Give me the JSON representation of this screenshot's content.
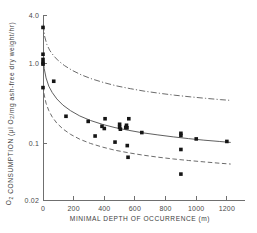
{
  "chart_data": {
    "type": "scatter",
    "title": "",
    "xlabel": "MINIMAL DEPTH OF OCCURRENCE (m)",
    "ylabel": "O₂ CONSUMPTION (μl O₂/mg ash-free dry weight/hr)",
    "ylabel_parts": {
      "prefix": "O",
      "sub1": "2",
      "mid": " CONSUMPTION (μl O",
      "sub2": "2",
      "suffix": "/mg ash-free dry weight/hr)"
    },
    "xscale": "linear",
    "yscale": "log",
    "xlim": [
      0,
      1240
    ],
    "ylim": [
      0.02,
      4.0
    ],
    "grid": false,
    "legend": "none",
    "xticks": [
      0,
      200,
      400,
      600,
      800,
      1000,
      1200
    ],
    "xticklabels": [
      "0",
      "200",
      "400",
      "600",
      "800",
      "1000",
      "1200"
    ],
    "yticks": [
      4.0,
      1.0,
      0.1,
      0.02
    ],
    "yticklabels": [
      "4.0",
      "1.0",
      "0.1",
      "0.02"
    ],
    "series": [
      {
        "name": "observations",
        "marker": "filled-square",
        "points": [
          [
            0,
            2.8
          ],
          [
            0,
            1.3
          ],
          [
            0,
            1.12
          ],
          [
            0,
            1.02
          ],
          [
            0,
            0.98
          ],
          [
            0,
            0.5
          ],
          [
            70,
            0.6
          ],
          [
            150,
            0.22
          ],
          [
            295,
            0.19
          ],
          [
            340,
            0.125
          ],
          [
            385,
            0.165
          ],
          [
            400,
            0.155
          ],
          [
            405,
            0.205
          ],
          [
            470,
            0.105
          ],
          [
            500,
            0.175
          ],
          [
            500,
            0.16
          ],
          [
            505,
            0.152
          ],
          [
            540,
            0.16
          ],
          [
            545,
            0.17
          ],
          [
            548,
            0.158
          ],
          [
            550,
            0.095
          ],
          [
            555,
            0.068
          ],
          [
            560,
            0.205
          ],
          [
            645,
            0.138
          ],
          [
            900,
            0.135
          ],
          [
            900,
            0.127
          ],
          [
            900,
            0.085
          ],
          [
            900,
            0.042
          ],
          [
            1000,
            0.115
          ],
          [
            1200,
            0.107
          ]
        ]
      }
    ],
    "curves": [
      {
        "name": "upper-confidence-limit",
        "style": "dash-dot",
        "points": [
          [
            2,
            3.05
          ],
          [
            10,
            2.2
          ],
          [
            25,
            1.72
          ],
          [
            45,
            1.44
          ],
          [
            70,
            1.24
          ],
          [
            100,
            1.08
          ],
          [
            140,
            0.94
          ],
          [
            190,
            0.82
          ],
          [
            250,
            0.72
          ],
          [
            320,
            0.64
          ],
          [
            400,
            0.575
          ],
          [
            480,
            0.525
          ],
          [
            570,
            0.485
          ],
          [
            660,
            0.452
          ],
          [
            760,
            0.425
          ],
          [
            860,
            0.402
          ],
          [
            960,
            0.384
          ],
          [
            1060,
            0.368
          ],
          [
            1160,
            0.354
          ],
          [
            1215,
            0.348
          ]
        ]
      },
      {
        "name": "regression-line",
        "style": "solid",
        "points": [
          [
            1,
            1.15
          ],
          [
            8,
            0.86
          ],
          [
            20,
            0.66
          ],
          [
            38,
            0.52
          ],
          [
            60,
            0.435
          ],
          [
            90,
            0.362
          ],
          [
            130,
            0.303
          ],
          [
            180,
            0.258
          ],
          [
            240,
            0.222
          ],
          [
            310,
            0.195
          ],
          [
            390,
            0.174
          ],
          [
            470,
            0.159
          ],
          [
            560,
            0.147
          ],
          [
            650,
            0.137
          ],
          [
            750,
            0.129
          ],
          [
            850,
            0.122
          ],
          [
            950,
            0.116
          ],
          [
            1050,
            0.111
          ],
          [
            1150,
            0.107
          ],
          [
            1225,
            0.104
          ]
        ]
      },
      {
        "name": "lower-confidence-limit",
        "style": "dashed",
        "points": [
          [
            1,
            0.52
          ],
          [
            8,
            0.405
          ],
          [
            20,
            0.32
          ],
          [
            38,
            0.258
          ],
          [
            60,
            0.216
          ],
          [
            90,
            0.181
          ],
          [
            130,
            0.153
          ],
          [
            180,
            0.131
          ],
          [
            240,
            0.114
          ],
          [
            310,
            0.101
          ],
          [
            390,
            0.0908
          ],
          [
            470,
            0.0832
          ],
          [
            560,
            0.0772
          ],
          [
            650,
            0.0724
          ],
          [
            750,
            0.0682
          ],
          [
            850,
            0.0648
          ],
          [
            950,
            0.062
          ],
          [
            1050,
            0.0596
          ],
          [
            1150,
            0.0574
          ],
          [
            1225,
            0.056
          ]
        ]
      }
    ]
  }
}
